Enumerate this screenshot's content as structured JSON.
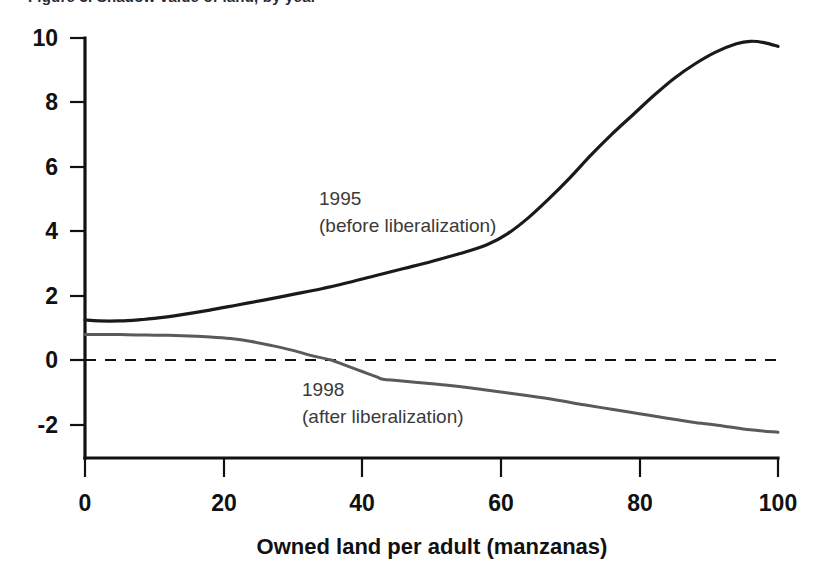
{
  "figure": {
    "clipped_header_text": "Figure 3. Shadow value of land, by year",
    "background_color": "#ffffff"
  },
  "chart_data": {
    "type": "line",
    "title": "",
    "subtitle": "",
    "xlabel": "Owned land per adult (manzanas)",
    "ylabel": "",
    "xlim": [
      0,
      100
    ],
    "ylim": [
      -3,
      10
    ],
    "xticks": [
      0,
      20,
      40,
      60,
      80,
      100
    ],
    "xtick_labels": [
      "0",
      "20",
      "40",
      "60",
      "80",
      "100"
    ],
    "yticks": [
      -2,
      0,
      2,
      4,
      6,
      8,
      10
    ],
    "ytick_labels": [
      "-2",
      "0",
      "2",
      "4",
      "6",
      "8",
      "10"
    ],
    "grid": false,
    "legend_position": "inline-annotation",
    "zero_reference_line": {
      "value": 0,
      "style": "dashed",
      "color": "#111111"
    },
    "series": [
      {
        "name": "1995",
        "label_line1": "1995",
        "label_line2": "(before liberalization)",
        "color": "#1a1a1a",
        "stroke_width": 3.2,
        "x": [
          0,
          2,
          5,
          8,
          10,
          14,
          18,
          22,
          26,
          30,
          34,
          38,
          42,
          46,
          50,
          54,
          58,
          61,
          64,
          67,
          70,
          73,
          76,
          79,
          82,
          85,
          88,
          91,
          94,
          96,
          98,
          100
        ],
        "y": [
          1.25,
          1.22,
          1.22,
          1.26,
          1.3,
          1.42,
          1.56,
          1.72,
          1.88,
          2.05,
          2.22,
          2.42,
          2.64,
          2.86,
          3.08,
          3.32,
          3.6,
          3.95,
          4.45,
          5.05,
          5.7,
          6.4,
          7.05,
          7.65,
          8.25,
          8.8,
          9.25,
          9.62,
          9.88,
          9.96,
          9.92,
          9.8
        ]
      },
      {
        "name": "1998",
        "label_line1": "1998",
        "label_line2": "(after liberalization)",
        "color": "#5a5a5a",
        "stroke_width": 3.0,
        "x": [
          0,
          3,
          6,
          9,
          12,
          15,
          18,
          21,
          24,
          27,
          30,
          33,
          35.5,
          38,
          40,
          42,
          43,
          45,
          48,
          52,
          56,
          60,
          64,
          68,
          72,
          76,
          80,
          84,
          88,
          92,
          96,
          100
        ],
        "y": [
          0.8,
          0.8,
          0.79,
          0.78,
          0.77,
          0.75,
          0.72,
          0.67,
          0.58,
          0.45,
          0.3,
          0.12,
          0.0,
          -0.2,
          -0.36,
          -0.52,
          -0.6,
          -0.64,
          -0.7,
          -0.78,
          -0.88,
          -1.0,
          -1.12,
          -1.25,
          -1.4,
          -1.54,
          -1.68,
          -1.82,
          -1.95,
          -2.06,
          -2.18,
          -2.26
        ]
      }
    ],
    "annotations": [
      {
        "series": "1995",
        "line1": "1995",
        "line2": "(before liberalization)",
        "x_px": 319,
        "y_px": 205
      },
      {
        "series": "1998",
        "line1": "1998",
        "line2": "(after liberalization)",
        "x_px": 302,
        "y_px": 396
      }
    ]
  }
}
